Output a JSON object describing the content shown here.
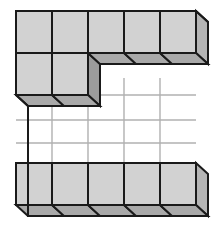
{
  "figure": {
    "type": "isometric-unit-cube-assembly",
    "canvas": {
      "width": 217,
      "height": 234,
      "background": "#ffffff"
    },
    "projection": {
      "cell_width": 36,
      "cell_height": 42,
      "depth_dx": -14,
      "depth_dy": 17,
      "origin_x": 16,
      "origin_y": 11
    },
    "colors": {
      "front_face": "#d2d2d2",
      "top_or_bottom_face": "#a9a9a9",
      "side_face": "#b5b5b5",
      "empty_back_wall": "#ffffff",
      "outline": "#1a1a1a",
      "grid_line": "#b0b0b0"
    },
    "counts": {
      "columns": 5,
      "rows": 5,
      "top_row_cubes": 5,
      "second_row_cubes": 2,
      "bottom_row_cubes": 5,
      "total_visible_cubes": 12
    },
    "grid_occupancy": [
      [
        1,
        1,
        1,
        1,
        1
      ],
      [
        1,
        1,
        0,
        0,
        0
      ],
      [
        0,
        0,
        0,
        0,
        0
      ],
      [
        0,
        0,
        0,
        0,
        0
      ],
      [
        1,
        1,
        1,
        1,
        1
      ]
    ]
  }
}
